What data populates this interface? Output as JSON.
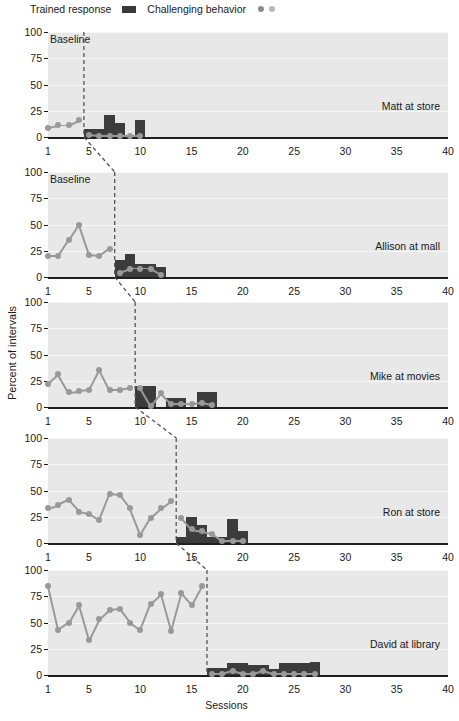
{
  "legend": {
    "trained_label": "Trained response",
    "challenging_label": "Challenging behavior",
    "trained_color": "#3c3c3c",
    "challenging_color": "#999999",
    "challenging_color_2": "#b8b8b8"
  },
  "axis": {
    "y_title": "Percent of intervals",
    "x_title": "Sessions",
    "y_ticks": [
      "0",
      "25",
      "50",
      "75",
      "100"
    ],
    "x_ticks": [
      "1",
      "5",
      "10",
      "15",
      "20",
      "25",
      "30",
      "35",
      "40"
    ],
    "baseline_note": "Baseline"
  },
  "chart_data": {
    "type": "line",
    "title": "",
    "subtitle": "",
    "xlabel": "Sessions",
    "ylabel": "Percent of intervals",
    "xlim": [
      1,
      40
    ],
    "ylim": [
      0,
      100
    ],
    "grid": true,
    "legend_position": "top-left",
    "legend_entries": [
      "Trained response",
      "Challenging behavior"
    ],
    "design": "multiple-baseline-across-participants",
    "panels": [
      {
        "name": "Matt at store",
        "phase_change_session": 4.5,
        "baseline_note": "Baseline",
        "challenging_behavior": {
          "x": [
            1,
            2,
            3,
            4,
            5,
            6,
            7,
            8,
            9,
            10
          ],
          "y": [
            9,
            11,
            11,
            16,
            2,
            1,
            1,
            1,
            1,
            1
          ]
        },
        "trained_response": {
          "x": [
            5,
            6,
            7,
            8,
            9,
            10
          ],
          "y": [
            8,
            8,
            21,
            13,
            0,
            16
          ]
        }
      },
      {
        "name": "Allison at mall",
        "phase_change_session": 7.5,
        "baseline_note": "Baseline",
        "challenging_behavior": {
          "x": [
            1,
            2,
            3,
            4,
            5,
            6,
            7,
            8,
            9,
            10,
            11,
            12
          ],
          "y": [
            20,
            20,
            35,
            50,
            21,
            20,
            27,
            4,
            8,
            8,
            8,
            2
          ]
        },
        "trained_response": {
          "x": [
            8,
            9,
            10,
            11,
            12
          ],
          "y": [
            16,
            22,
            12,
            12,
            10
          ]
        }
      },
      {
        "name": "Mike at movies",
        "phase_change_session": 9.5,
        "baseline_note": "",
        "challenging_behavior": {
          "x": [
            1,
            2,
            3,
            4,
            5,
            6,
            7,
            8,
            9,
            10,
            11,
            12,
            13,
            14,
            15,
            16,
            17
          ],
          "y": [
            22,
            31,
            14,
            15,
            16,
            35,
            16,
            16,
            18,
            18,
            1,
            13,
            3,
            3,
            3,
            4,
            2
          ]
        },
        "trained_response": {
          "x": [
            10,
            11,
            12,
            13,
            14,
            15,
            16,
            17
          ],
          "y": [
            20,
            20,
            0,
            9,
            9,
            0,
            14,
            14
          ]
        }
      },
      {
        "name": "Ron at store",
        "phase_change_session": 13.5,
        "baseline_note": "",
        "challenging_behavior": {
          "x": [
            1,
            2,
            3,
            4,
            5,
            6,
            7,
            8,
            9,
            10,
            11,
            12,
            13,
            14,
            15,
            16,
            17,
            18,
            19,
            20
          ],
          "y": [
            33,
            36,
            41,
            30,
            28,
            22,
            47,
            46,
            33,
            8,
            24,
            33,
            40,
            24,
            13,
            11,
            9,
            2,
            2,
            2
          ]
        },
        "trained_response": {
          "x": [
            14,
            15,
            16,
            17,
            18,
            19,
            20
          ],
          "y": [
            6,
            25,
            17,
            6,
            6,
            23,
            11
          ]
        }
      },
      {
        "name": "David at library",
        "phase_change_session": 16.5,
        "baseline_note": "",
        "challenging_behavior": {
          "x": [
            1,
            2,
            3,
            4,
            5,
            6,
            7,
            8,
            9,
            10,
            11,
            12,
            13,
            14,
            15,
            16,
            17,
            18,
            19,
            20,
            21,
            22,
            23,
            24,
            25,
            26,
            27
          ],
          "y": [
            85,
            43,
            50,
            67,
            33,
            53,
            62,
            63,
            50,
            43,
            68,
            77,
            42,
            78,
            67,
            85,
            1,
            1,
            4,
            1,
            1,
            4,
            1,
            1,
            1,
            1,
            1
          ]
        },
        "trained_response": {
          "x": [
            17,
            18,
            19,
            20,
            21,
            22,
            23,
            24,
            25,
            26,
            27
          ],
          "y": [
            7,
            7,
            11,
            11,
            10,
            10,
            6,
            11,
            11,
            11,
            12
          ]
        }
      }
    ]
  }
}
